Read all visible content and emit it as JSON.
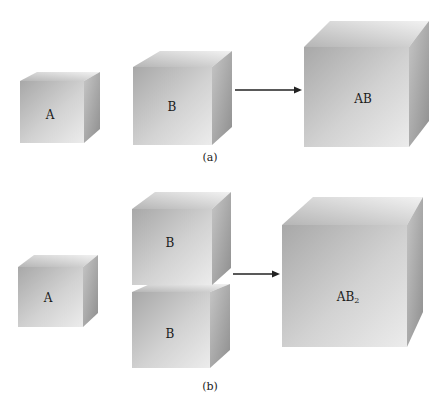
{
  "figure": {
    "panels": [
      {
        "caption": "(a)",
        "reactants": [
          "A",
          "B"
        ],
        "product": "AB",
        "product_subscript": ""
      },
      {
        "caption": "(b)",
        "reactants": [
          "A",
          "B",
          "B"
        ],
        "product": "AB",
        "product_subscript": "2"
      }
    ]
  },
  "colors": {
    "front_dark": "#a9a9a9",
    "front_light": "#e6e6e6",
    "top": "#cfcfcf",
    "side": "#9d9d9d",
    "arrow": "#222222"
  }
}
